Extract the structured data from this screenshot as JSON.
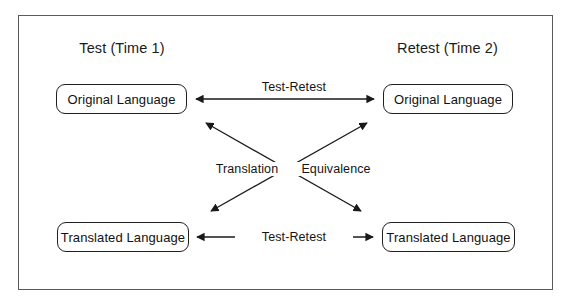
{
  "figure": {
    "type": "diagram",
    "layout": "2x2-matrix-with-crossed-arrows",
    "columns": [
      {
        "id": "time1",
        "header": "Test (Time 1)"
      },
      {
        "id": "time2",
        "header": "Retest (Time 2)"
      }
    ],
    "nodes": [
      {
        "id": "top-left",
        "label": "Original Language",
        "column": "time1",
        "row": "top"
      },
      {
        "id": "top-right",
        "label": "Original Language",
        "column": "time2",
        "row": "top"
      },
      {
        "id": "bottom-left",
        "label": "Translated Language",
        "column": "time1",
        "row": "bottom"
      },
      {
        "id": "bottom-right",
        "label": "Translated Language",
        "column": "time2",
        "row": "bottom"
      }
    ],
    "edges": [
      {
        "id": "top-horizontal",
        "label": "Test-Retest",
        "from": "top-left",
        "to": "top-right",
        "arrowheads": "both",
        "style": "horizontal"
      },
      {
        "id": "bottom-horizontal",
        "label": "Test-Retest",
        "from": "bottom-left",
        "to": "bottom-right",
        "arrowheads": "both",
        "style": "horizontal"
      },
      {
        "id": "diagonal-down",
        "label": "Equivalence",
        "from": "top-left",
        "to": "bottom-right",
        "arrowheads": "both",
        "style": "diagonal"
      },
      {
        "id": "diagonal-up",
        "label": "Translation",
        "from": "bottom-left",
        "to": "top-right",
        "arrowheads": "both",
        "style": "diagonal"
      }
    ],
    "colors": {
      "frame_border": "#5a5a5a",
      "box_border": "#1f1f1f",
      "arrow": "#1a1a1a",
      "text": "#111111",
      "background": "#ffffff"
    }
  }
}
